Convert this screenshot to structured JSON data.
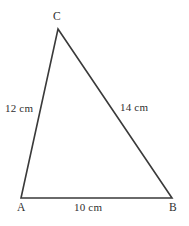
{
  "figure": {
    "kind": "triangle-diagram",
    "background_color": "#ffffff",
    "stroke_color": "#3a3a3a",
    "text_color": "#2f2f2f",
    "width": 189,
    "height": 226,
    "vertices": [
      {
        "id": "C",
        "label": "C",
        "x": 58,
        "y": 29
      },
      {
        "id": "A",
        "label": "A",
        "x": 21,
        "y": 198
      },
      {
        "id": "B",
        "label": "B",
        "x": 172,
        "y": 198
      }
    ],
    "sides": [
      {
        "id": "AC",
        "from": "A",
        "to": "C",
        "label": "12 cm",
        "length": 12,
        "unit": "cm"
      },
      {
        "id": "CB",
        "from": "C",
        "to": "B",
        "label": "14 cm",
        "length": 14,
        "unit": "cm"
      },
      {
        "id": "AB",
        "from": "A",
        "to": "B",
        "label": "10 cm",
        "length": 10,
        "unit": "cm"
      }
    ]
  },
  "labels": {
    "vertex_c": "C",
    "vertex_a": "A",
    "vertex_b": "B",
    "side_ac": "12 cm",
    "side_cb": "14 cm",
    "side_ab": "10 cm"
  }
}
